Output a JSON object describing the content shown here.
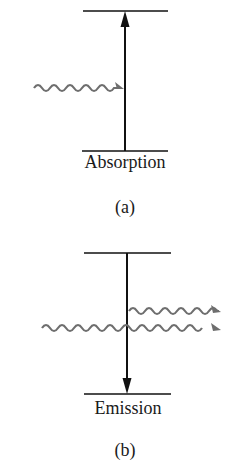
{
  "diagram": {
    "panels": [
      {
        "id": "a",
        "caption": "(a)",
        "process_label": "Absorption",
        "transition_direction": "up",
        "incoming_photons": 1,
        "outgoing_photons": 0
      },
      {
        "id": "b",
        "caption": "(b)",
        "process_label": "Emission",
        "transition_direction": "down",
        "incoming_photons": 1,
        "outgoing_photons": 2
      }
    ],
    "colors": {
      "level_line": "#111111",
      "transition_arrow": "#111111",
      "photon_wave": "#6e6e6e",
      "background": "#ffffff"
    }
  }
}
